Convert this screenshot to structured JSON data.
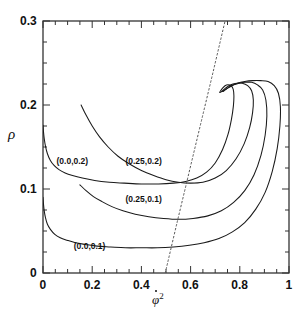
{
  "chart_data": {
    "type": "line",
    "title": "",
    "xlabel": "phidot^2",
    "xlabel_display": "φ̇²",
    "ylabel": "rho",
    "ylabel_display": "ρ",
    "xlim": [
      0,
      1
    ],
    "ylim": [
      0,
      0.3
    ],
    "grid": false,
    "legend": "inline-annotations",
    "xticks": [
      0,
      0.2,
      0.4,
      0.6,
      0.8,
      1
    ],
    "xtick_labels": [
      "0",
      "0.2",
      "0.4",
      "0.6",
      "0.8",
      "1"
    ],
    "xminor_ticks": [
      0.05,
      0.1,
      0.15,
      0.25,
      0.3,
      0.35,
      0.45,
      0.5,
      0.55,
      0.65,
      0.7,
      0.75,
      0.85,
      0.9,
      0.95
    ],
    "yticks": [
      0,
      0.1,
      0.2,
      0.3
    ],
    "ytick_labels": [
      "0",
      "0.1",
      "0.2",
      "0.3"
    ],
    "yminor_ticks": [
      0.025,
      0.05,
      0.075,
      0.125,
      0.15,
      0.175,
      0.225,
      0.25,
      0.275
    ],
    "annotations": [
      {
        "text": "(0.0,0.2)",
        "x": 0.055,
        "y": 0.133
      },
      {
        "text": "(0.25,0.2)",
        "x": 0.335,
        "y": 0.133
      },
      {
        "text": "(0.25,0.1)",
        "x": 0.335,
        "y": 0.087
      },
      {
        "text": "(0.0,0.1)",
        "x": 0.125,
        "y": 0.031
      }
    ],
    "series": [
      {
        "name": "(0.0,0.2)",
        "style": "solid",
        "color": "#1a1a1a",
        "points": [
          [
            0.0,
            0.176
          ],
          [
            0.002,
            0.168
          ],
          [
            0.005,
            0.16
          ],
          [
            0.01,
            0.151
          ],
          [
            0.018,
            0.142
          ],
          [
            0.03,
            0.134
          ],
          [
            0.045,
            0.128
          ],
          [
            0.065,
            0.123
          ],
          [
            0.09,
            0.119
          ],
          [
            0.12,
            0.116
          ],
          [
            0.16,
            0.113
          ],
          [
            0.21,
            0.11
          ],
          [
            0.27,
            0.108
          ],
          [
            0.33,
            0.107
          ],
          [
            0.4,
            0.106
          ],
          [
            0.47,
            0.106
          ],
          [
            0.53,
            0.107
          ],
          [
            0.58,
            0.109
          ],
          [
            0.625,
            0.113
          ],
          [
            0.665,
            0.12
          ],
          [
            0.7,
            0.131
          ],
          [
            0.73,
            0.147
          ],
          [
            0.752,
            0.165
          ],
          [
            0.766,
            0.183
          ],
          [
            0.774,
            0.199
          ],
          [
            0.776,
            0.211
          ],
          [
            0.773,
            0.219
          ],
          [
            0.764,
            0.223
          ],
          [
            0.752,
            0.224
          ],
          [
            0.74,
            0.223
          ],
          [
            0.73,
            0.22
          ],
          [
            0.722,
            0.217
          ],
          [
            0.718,
            0.215
          ]
        ]
      },
      {
        "name": "(0.25,0.2)",
        "style": "solid",
        "color": "#1a1a1a",
        "points": [
          [
            0.155,
            0.2
          ],
          [
            0.175,
            0.188
          ],
          [
            0.2,
            0.175
          ],
          [
            0.23,
            0.162
          ],
          [
            0.265,
            0.15
          ],
          [
            0.305,
            0.139
          ],
          [
            0.35,
            0.13
          ],
          [
            0.4,
            0.122
          ],
          [
            0.45,
            0.116
          ],
          [
            0.5,
            0.111
          ],
          [
            0.55,
            0.108
          ],
          [
            0.6,
            0.107
          ],
          [
            0.65,
            0.108
          ],
          [
            0.7,
            0.113
          ],
          [
            0.745,
            0.122
          ],
          [
            0.785,
            0.136
          ],
          [
            0.818,
            0.154
          ],
          [
            0.84,
            0.173
          ],
          [
            0.852,
            0.191
          ],
          [
            0.855,
            0.206
          ],
          [
            0.848,
            0.217
          ],
          [
            0.832,
            0.223
          ],
          [
            0.81,
            0.226
          ],
          [
            0.79,
            0.226
          ],
          [
            0.772,
            0.225
          ],
          [
            0.756,
            0.223
          ],
          [
            0.742,
            0.22
          ],
          [
            0.73,
            0.217
          ],
          [
            0.722,
            0.215
          ]
        ]
      },
      {
        "name": "(0.25,0.1)",
        "style": "solid",
        "color": "#1a1a1a",
        "points": [
          [
            0.15,
            0.105
          ],
          [
            0.175,
            0.098
          ],
          [
            0.205,
            0.091
          ],
          [
            0.24,
            0.085
          ],
          [
            0.28,
            0.079
          ],
          [
            0.325,
            0.074
          ],
          [
            0.375,
            0.07
          ],
          [
            0.43,
            0.067
          ],
          [
            0.49,
            0.065
          ],
          [
            0.55,
            0.064
          ],
          [
            0.61,
            0.065
          ],
          [
            0.67,
            0.068
          ],
          [
            0.725,
            0.074
          ],
          [
            0.775,
            0.084
          ],
          [
            0.82,
            0.098
          ],
          [
            0.858,
            0.117
          ],
          [
            0.886,
            0.14
          ],
          [
            0.903,
            0.164
          ],
          [
            0.91,
            0.187
          ],
          [
            0.906,
            0.206
          ],
          [
            0.893,
            0.218
          ],
          [
            0.872,
            0.224
          ],
          [
            0.848,
            0.227
          ],
          [
            0.822,
            0.227
          ],
          [
            0.798,
            0.226
          ],
          [
            0.776,
            0.224
          ],
          [
            0.757,
            0.221
          ],
          [
            0.74,
            0.218
          ],
          [
            0.728,
            0.216
          ]
        ]
      },
      {
        "name": "(0.0,0.1)",
        "style": "solid",
        "color": "#1a1a1a",
        "points": [
          [
            0.0,
            0.09
          ],
          [
            0.002,
            0.082
          ],
          [
            0.005,
            0.074
          ],
          [
            0.01,
            0.066
          ],
          [
            0.018,
            0.058
          ],
          [
            0.03,
            0.052
          ],
          [
            0.048,
            0.046
          ],
          [
            0.07,
            0.042
          ],
          [
            0.098,
            0.039
          ],
          [
            0.132,
            0.036
          ],
          [
            0.172,
            0.034
          ],
          [
            0.22,
            0.032
          ],
          [
            0.275,
            0.031
          ],
          [
            0.335,
            0.03
          ],
          [
            0.4,
            0.03
          ],
          [
            0.465,
            0.03
          ],
          [
            0.53,
            0.031
          ],
          [
            0.595,
            0.033
          ],
          [
            0.655,
            0.036
          ],
          [
            0.715,
            0.041
          ],
          [
            0.77,
            0.049
          ],
          [
            0.82,
            0.06
          ],
          [
            0.865,
            0.076
          ],
          [
            0.903,
            0.096
          ],
          [
            0.932,
            0.121
          ],
          [
            0.952,
            0.148
          ],
          [
            0.963,
            0.175
          ],
          [
            0.965,
            0.198
          ],
          [
            0.957,
            0.214
          ],
          [
            0.94,
            0.223
          ],
          [
            0.915,
            0.228
          ],
          [
            0.885,
            0.229
          ],
          [
            0.852,
            0.229
          ],
          [
            0.82,
            0.228
          ],
          [
            0.79,
            0.226
          ],
          [
            0.765,
            0.223
          ],
          [
            0.745,
            0.219
          ],
          [
            0.732,
            0.216
          ]
        ]
      },
      {
        "name": "separatrix",
        "style": "dashed",
        "color": "#555555",
        "points": [
          [
            0.497,
            0.0
          ],
          [
            0.545,
            0.06
          ],
          [
            0.594,
            0.12
          ],
          [
            0.643,
            0.18
          ],
          [
            0.692,
            0.24
          ],
          [
            0.74,
            0.3
          ]
        ]
      }
    ]
  },
  "figure": {
    "background": "#ffffff",
    "axis_color": "#333333",
    "text_color": "#111111"
  }
}
